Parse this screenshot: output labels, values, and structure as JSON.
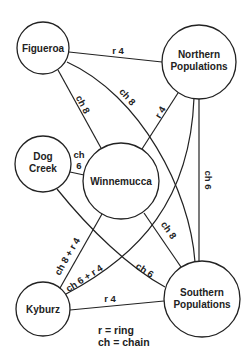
{
  "diagram": {
    "nodes": [
      {
        "id": "figueroa",
        "label": [
          "Figueroa"
        ]
      },
      {
        "id": "northern",
        "label": [
          "Northern",
          "Populations"
        ]
      },
      {
        "id": "dogcreek",
        "label": [
          "Dog",
          "Creek"
        ]
      },
      {
        "id": "winnemucca",
        "label": [
          "Winnemucca"
        ]
      },
      {
        "id": "kyburz",
        "label": [
          "Kyburz"
        ]
      },
      {
        "id": "southern",
        "label": [
          "Southern",
          "Populations"
        ]
      }
    ],
    "edges": [
      {
        "from": "figueroa",
        "to": "northern",
        "label": "r 4"
      },
      {
        "from": "figueroa",
        "to": "winnemucca",
        "label": "ch 8"
      },
      {
        "from": "figueroa",
        "to": "southern",
        "label": "ch 8"
      },
      {
        "from": "northern",
        "to": "winnemucca",
        "label": "r 4"
      },
      {
        "from": "northern",
        "to": "southern",
        "label": "ch 6"
      },
      {
        "from": "northern",
        "to": "kyburz",
        "label": "ch 6 + r 4"
      },
      {
        "from": "dogcreek",
        "to": "winnemucca",
        "label": [
          "ch",
          "6"
        ]
      },
      {
        "from": "dogcreek",
        "to": "southern",
        "label": "ch 6"
      },
      {
        "from": "winnemucca",
        "to": "kyburz",
        "label": "ch 8 + r 4"
      },
      {
        "from": "winnemucca",
        "to": "southern",
        "label": "ch 8"
      },
      {
        "from": "kyburz",
        "to": "southern",
        "label": "r 4"
      }
    ],
    "legend": [
      "r = ring",
      "ch = chain"
    ]
  }
}
